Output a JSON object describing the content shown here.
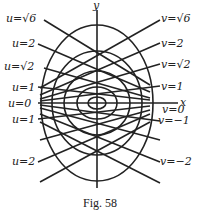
{
  "figure": {
    "caption": "Fig. 58",
    "axes": {
      "x_label": "x",
      "y_label": "y"
    },
    "u_labels": [
      "u=√6",
      "u=2",
      "u=√2",
      "u=1",
      "u=0",
      "u=1",
      "u=2"
    ],
    "v_labels": [
      "v=√6",
      "v=2",
      "v=√2",
      "v=1",
      "v=0",
      "v=−1",
      "v=−2"
    ]
  }
}
